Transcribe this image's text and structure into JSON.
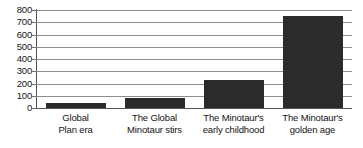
{
  "chart_data": {
    "type": "bar",
    "title": "",
    "subtitle": "",
    "xlabel": "",
    "ylabel": "",
    "categories": [
      "Global Plan era",
      "The Global Minotaur stirs",
      "The Minotaur's early childhood",
      "The Minotaur's golden age"
    ],
    "category_lines": [
      [
        "Global",
        "Plan era"
      ],
      [
        "The Global",
        "Minotaur stirs"
      ],
      [
        "The Minotaur's",
        "early childhood"
      ],
      [
        "The Minotaur's",
        "golden age"
      ]
    ],
    "values": [
      40,
      80,
      225,
      750
    ],
    "ylim": [
      0,
      800
    ],
    "ytick_values": [
      0,
      100,
      200,
      300,
      400,
      500,
      600,
      700,
      800
    ],
    "ytick_labels": [
      "0",
      "100",
      "200",
      "300",
      "400",
      "500",
      "600",
      "700",
      "800"
    ],
    "grid": true,
    "grid_axis": "y",
    "legend": false,
    "legend_position": "none",
    "bar_color": "#2b2b2b",
    "gridline_color": "#8d8d8d",
    "axis_color": "#555555",
    "background_color": "#ffffff",
    "text_color": "#141414"
  }
}
